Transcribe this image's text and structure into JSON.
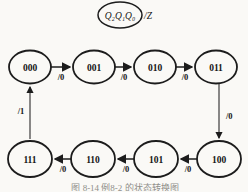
{
  "legend": {
    "variables": "Q₂Q₁Q₀",
    "output": "/Z"
  },
  "states": {
    "top": [
      "000",
      "001",
      "010",
      "011"
    ],
    "bottom": [
      "111",
      "110",
      "101",
      "100"
    ]
  },
  "transitions": {
    "top": [
      "/0",
      "/0",
      "/0"
    ],
    "right": "/0",
    "bottom": [
      "/0",
      "/0",
      "/0"
    ],
    "left": "/1"
  },
  "caption": "图 8-14  例8-2 的状态转换图",
  "colors": {
    "ink": "#1c1c1c",
    "background": "#faf9f6",
    "caption_gray": "#8f8f8a"
  }
}
